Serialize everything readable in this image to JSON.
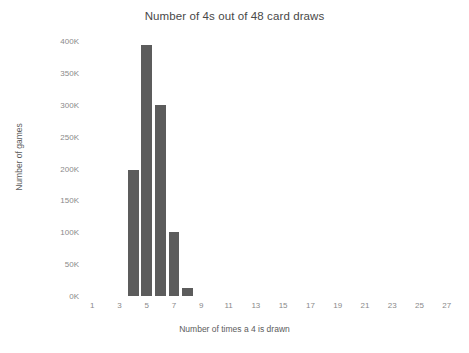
{
  "chart_data": {
    "type": "bar",
    "title": "Number of 4s out of 48 card draws",
    "xlabel": "Number of times a 4 is drawn",
    "ylabel": "Number of games",
    "categories": [
      1,
      2,
      3,
      4,
      5,
      6,
      7,
      8,
      9,
      10,
      11,
      12,
      13,
      14,
      15,
      16,
      17,
      18,
      19,
      20,
      21,
      22,
      23,
      24,
      25,
      26,
      27
    ],
    "values": [
      0,
      0,
      0,
      198000,
      393000,
      299000,
      100000,
      12000,
      0,
      0,
      0,
      0,
      0,
      0,
      0,
      0,
      0,
      0,
      0,
      0,
      0,
      0,
      0,
      0,
      0,
      0,
      0
    ],
    "xtick_labels": [
      "1",
      "3",
      "5",
      "7",
      "9",
      "11",
      "13",
      "15",
      "17",
      "19",
      "21",
      "23",
      "25",
      "27"
    ],
    "xtick_values": [
      1,
      3,
      5,
      7,
      9,
      11,
      13,
      15,
      17,
      19,
      21,
      23,
      25,
      27
    ],
    "ytick_labels": [
      "0K",
      "50K",
      "100K",
      "150K",
      "200K",
      "250K",
      "300K",
      "350K",
      "400K"
    ],
    "ytick_values": [
      0,
      50000,
      100000,
      150000,
      200000,
      250000,
      300000,
      350000,
      400000
    ],
    "ylim": [
      0,
      400000
    ],
    "xlim": [
      0.4,
      27.6
    ],
    "grid": false,
    "legend": false,
    "bar_color": "#5c5c5c",
    "background_color": "#ffffff",
    "text_color": "#8a8a8a"
  }
}
